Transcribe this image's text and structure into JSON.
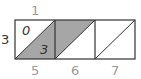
{
  "diagram": {
    "type": "lattice-multiplication",
    "carry_label": "1",
    "multiplier": "3",
    "multiplicand_digits": [
      "5",
      "6",
      "7"
    ],
    "cells": [
      {
        "top": "0",
        "bottom": "3",
        "shaded": "lower"
      },
      {
        "top": "",
        "bottom": "",
        "shaded": "upper"
      },
      {
        "top": "",
        "bottom": "",
        "shaded": "none"
      }
    ],
    "colors": {
      "shade": "#a6a6a6",
      "line": "#333333",
      "label": "#9a9a9a"
    }
  }
}
